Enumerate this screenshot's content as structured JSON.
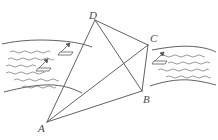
{
  "figure": {
    "canvas": {
      "width": 218,
      "height": 140,
      "background": "#ffffff"
    },
    "style": {
      "line_color": "#5a5a5a",
      "water_color": "#6b6b6b",
      "bank_color": "#4f4f4f",
      "label_color": "#4a4a4a",
      "line_width": 0.9
    },
    "vertices": [
      {
        "id": "A",
        "label": "A",
        "x": 47,
        "y": 122
      },
      {
        "id": "B",
        "label": "B",
        "x": 142,
        "y": 91
      },
      {
        "id": "C",
        "label": "C",
        "x": 148,
        "y": 45
      },
      {
        "id": "D",
        "label": "D",
        "x": 95,
        "y": 20
      }
    ],
    "edges": [
      {
        "name": "AD",
        "from": "A",
        "to": "D"
      },
      {
        "name": "DC",
        "from": "D",
        "to": "C"
      },
      {
        "name": "CB",
        "from": "C",
        "to": "B"
      },
      {
        "name": "BA",
        "from": "B",
        "to": "A"
      }
    ],
    "diagonals": [
      {
        "name": "AC",
        "from": "A",
        "to": "C"
      },
      {
        "name": "DB",
        "from": "D",
        "to": "B"
      }
    ],
    "river": {
      "name": "river-band",
      "left_bank_top": "M 2 44 C 20 40, 40 39, 62 41 C 74 42, 84 44, 92 47",
      "left_bank_bottom": "M 4 92 C 20 88, 38 84, 54 85 C 66 86, 74 89, 82 93",
      "right_bank_top": "M 152 50 C 168 47, 184 45, 198 47 C 206 48, 212 50, 216 52",
      "right_bank_bottom": "M 150 86 C 162 82, 176 79, 190 80 C 200 81, 209 83, 216 85",
      "wave_color": "#6f6f6f",
      "waves_left": [
        {
          "x": 10,
          "y": 52,
          "len": 40
        },
        {
          "x": 8,
          "y": 59,
          "len": 46
        },
        {
          "x": 6,
          "y": 66,
          "len": 30
        },
        {
          "x": 6,
          "y": 73,
          "len": 38
        },
        {
          "x": 14,
          "y": 80,
          "len": 44
        },
        {
          "x": 22,
          "y": 87,
          "len": 34
        }
      ],
      "waves_right": [
        {
          "x": 160,
          "y": 56,
          "len": 44
        },
        {
          "x": 168,
          "y": 63,
          "len": 42
        },
        {
          "x": 158,
          "y": 70,
          "len": 50
        },
        {
          "x": 166,
          "y": 77,
          "len": 44
        }
      ]
    },
    "boats": [
      {
        "name": "boat-left-upper",
        "x": 58,
        "y": 48,
        "scale": 1.0
      },
      {
        "name": "boat-left-lower",
        "x": 36,
        "y": 64,
        "scale": 1.0
      },
      {
        "name": "boat-right",
        "x": 152,
        "y": 57,
        "scale": 1.0
      }
    ]
  }
}
